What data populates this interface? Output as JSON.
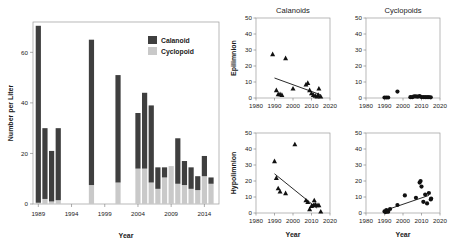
{
  "figure": {
    "panels": [
      "bar-chart",
      "calanoids-epilimnion",
      "cyclopoids-epilimnion",
      "calanoids-hypolimnion",
      "cyclopoids-hypolimnion"
    ],
    "colors": {
      "calanoid": "#3f3f3f",
      "cyclopoid": "#c9c9c9",
      "axis": "#8a8a8a",
      "marker": "#111111",
      "background": "#ffffff"
    }
  },
  "chart_data": [
    {
      "type": "bar",
      "id": "bar-chart",
      "title": "",
      "xlabel": "Year",
      "ylabel": "Number per Liter",
      "stacked": true,
      "ylim": [
        0,
        72
      ],
      "yticks": [
        0,
        20,
        40,
        60
      ],
      "ytick_labels": [
        "0",
        "20",
        "40",
        "60"
      ],
      "xlim": [
        1988.2,
        2016.2
      ],
      "xticks": [
        1989,
        1994,
        1999,
        2004,
        2009,
        2014
      ],
      "xtick_labels": [
        "1989",
        "1994",
        "1999",
        "2004",
        "2009",
        "2014"
      ],
      "categories": [
        1989,
        1990,
        1991,
        1992,
        1997,
        2001,
        2004,
        2005,
        2006,
        2007,
        2008,
        2009,
        2010,
        2011,
        2012,
        2013,
        2014,
        2015
      ],
      "series": [
        {
          "name": "Cyclopoid",
          "color": "#c9c9c9",
          "values": [
            0.5,
            2.0,
            1.0,
            1.5,
            7.5,
            8.5,
            14.0,
            14.0,
            8.5,
            6.0,
            10.5,
            15.0,
            8.0,
            7.5,
            6.0,
            5.5,
            11.0,
            8.0
          ]
        },
        {
          "name": "Calanoid",
          "color": "#3f3f3f",
          "values": [
            70.0,
            28.0,
            20.0,
            28.5,
            57.5,
            42.5,
            22.0,
            30.0,
            30.5,
            8.5,
            4.0,
            0.0,
            18.0,
            9.5,
            8.5,
            5.5,
            8.0,
            2.5
          ]
        }
      ],
      "totals": [
        70.5,
        30.0,
        21.0,
        30.0,
        65.0,
        51.0,
        36.0,
        44.0,
        39.0,
        14.5,
        14.5,
        15.0,
        26.0,
        17.0,
        14.5,
        11.0,
        19.0,
        10.5
      ],
      "legend": {
        "position": "top-right",
        "entries": [
          {
            "label": "Calanoid",
            "color": "#3f3f3f"
          },
          {
            "label": "Cyclopoid",
            "color": "#c9c9c9"
          }
        ]
      }
    },
    {
      "type": "scatter",
      "id": "calanoids-epilimnion",
      "title": "Calanoids",
      "ylabel": "Epilimnion",
      "xlabel": "",
      "marker": "triangle",
      "xlim": [
        1980,
        2020
      ],
      "ylim": [
        0,
        50
      ],
      "xticks": [
        1980,
        1990,
        2000,
        2010,
        2020
      ],
      "xtick_labels": [
        "1980",
        "1990",
        "2000",
        "2010",
        "2020"
      ],
      "yticks": [
        0,
        10,
        20,
        30,
        40,
        50
      ],
      "ytick_labels": [
        "0",
        "10",
        "20",
        "30",
        "40",
        "50"
      ],
      "points": [
        {
          "x": 1989,
          "y": 27.5
        },
        {
          "x": 1996,
          "y": 25.0
        },
        {
          "x": 1991,
          "y": 5.0
        },
        {
          "x": 1992,
          "y": 2.5
        },
        {
          "x": 1993,
          "y": 2.5
        },
        {
          "x": 1994,
          "y": 2.0
        },
        {
          "x": 2000,
          "y": 6.0
        },
        {
          "x": 2007,
          "y": 8.5
        },
        {
          "x": 2008,
          "y": 9.5
        },
        {
          "x": 2009,
          "y": 5.0
        },
        {
          "x": 2010,
          "y": 3.0
        },
        {
          "x": 2011,
          "y": 2.0
        },
        {
          "x": 2012,
          "y": 1.5
        },
        {
          "x": 2013,
          "y": 1.0
        },
        {
          "x": 2013.6,
          "y": 2.0
        },
        {
          "x": 2014,
          "y": 6.0
        },
        {
          "x": 2015,
          "y": 1.0
        }
      ],
      "trendline": {
        "x0": 1990,
        "y0": 12.5,
        "x1": 2015,
        "y1": 2.0
      }
    },
    {
      "type": "scatter",
      "id": "cyclopoids-epilimnion",
      "title": "Cyclopoids",
      "ylabel": "",
      "xlabel": "",
      "marker": "circle",
      "xlim": [
        1980,
        2020
      ],
      "ylim": [
        0,
        50
      ],
      "xticks": [
        1980,
        1990,
        2000,
        2010,
        2020
      ],
      "xtick_labels": [
        "1980",
        "1990",
        "2000",
        "2010",
        "2020"
      ],
      "yticks": [
        0,
        10,
        20,
        30,
        40,
        50
      ],
      "ytick_labels": [
        "0",
        "10",
        "20",
        "30",
        "40",
        "50"
      ],
      "points": [
        {
          "x": 1990,
          "y": 0.3
        },
        {
          "x": 1991,
          "y": 0.3
        },
        {
          "x": 1992,
          "y": 0.3
        },
        {
          "x": 1997,
          "y": 4.0
        },
        {
          "x": 2004,
          "y": 0.5
        },
        {
          "x": 2005,
          "y": 0.5
        },
        {
          "x": 2006,
          "y": 1.0
        },
        {
          "x": 2007,
          "y": 1.0
        },
        {
          "x": 2008,
          "y": 0.8
        },
        {
          "x": 2009,
          "y": 1.2
        },
        {
          "x": 2010,
          "y": 0.6
        },
        {
          "x": 2011,
          "y": 0.6
        },
        {
          "x": 2012,
          "y": 0.5
        },
        {
          "x": 2013,
          "y": 0.5
        },
        {
          "x": 2014,
          "y": 0.5
        },
        {
          "x": 2015,
          "y": 0.4
        }
      ],
      "trendline": null
    },
    {
      "type": "scatter",
      "id": "calanoids-hypolimnion",
      "title": "",
      "ylabel": "Hypolimnion",
      "xlabel": "Year",
      "marker": "triangle",
      "xlim": [
        1980,
        2020
      ],
      "ylim": [
        0,
        50
      ],
      "xticks": [
        1980,
        1990,
        2000,
        2010,
        2020
      ],
      "xtick_labels": [
        "1980",
        "1990",
        "2000",
        "2010",
        "2020"
      ],
      "yticks": [
        0,
        10,
        20,
        30,
        40,
        50
      ],
      "ytick_labels": [
        "0",
        "10",
        "20",
        "30",
        "40",
        "50"
      ],
      "points": [
        {
          "x": 1990,
          "y": 32.5
        },
        {
          "x": 2001,
          "y": 43.0
        },
        {
          "x": 1991,
          "y": 22.0
        },
        {
          "x": 1992,
          "y": 15.5
        },
        {
          "x": 1993,
          "y": 13.5
        },
        {
          "x": 1996,
          "y": 12.5
        },
        {
          "x": 2007,
          "y": 8.0
        },
        {
          "x": 2008,
          "y": 7.0
        },
        {
          "x": 2009,
          "y": 2.5
        },
        {
          "x": 2010,
          "y": 4.5
        },
        {
          "x": 2011,
          "y": 5.0
        },
        {
          "x": 2011.5,
          "y": 8.0
        },
        {
          "x": 2012,
          "y": 5.5
        },
        {
          "x": 2013,
          "y": 5.0
        },
        {
          "x": 2014,
          "y": 5.0
        },
        {
          "x": 2015,
          "y": 1.0
        }
      ],
      "trendline": {
        "x0": 1990,
        "y0": 24.5,
        "x1": 2013,
        "y1": 3.0
      }
    },
    {
      "type": "scatter",
      "id": "cyclopoids-hypolimnion",
      "title": "",
      "ylabel": "",
      "xlabel": "Year",
      "marker": "circle",
      "xlim": [
        1980,
        2020
      ],
      "ylim": [
        0,
        50
      ],
      "xticks": [
        1980,
        1990,
        2000,
        2010,
        2020
      ],
      "xtick_labels": [
        "1980",
        "1990",
        "2000",
        "2010",
        "2020"
      ],
      "yticks": [
        0,
        10,
        20,
        30,
        40,
        50
      ],
      "ytick_labels": [
        "0",
        "10",
        "20",
        "30",
        "40",
        "50"
      ],
      "points": [
        {
          "x": 1990,
          "y": 1.0
        },
        {
          "x": 1990.6,
          "y": 0.6
        },
        {
          "x": 1991,
          "y": 1.8
        },
        {
          "x": 1991.6,
          "y": 1.0
        },
        {
          "x": 1992,
          "y": 0.8
        },
        {
          "x": 1993,
          "y": 2.5
        },
        {
          "x": 1997,
          "y": 5.0
        },
        {
          "x": 2001,
          "y": 11.0
        },
        {
          "x": 2007,
          "y": 9.5
        },
        {
          "x": 2009,
          "y": 19.0
        },
        {
          "x": 2009.5,
          "y": 20.0
        },
        {
          "x": 2010,
          "y": 16.5
        },
        {
          "x": 2011,
          "y": 7.0
        },
        {
          "x": 2012,
          "y": 11.5
        },
        {
          "x": 2013,
          "y": 6.0
        },
        {
          "x": 2014,
          "y": 12.5
        },
        {
          "x": 2015,
          "y": 8.5
        },
        {
          "x": 2015.2,
          "y": 9.0
        }
      ],
      "trendline": {
        "x0": 1990,
        "y0": 1.5,
        "x1": 2014,
        "y1": 11.0
      }
    }
  ]
}
